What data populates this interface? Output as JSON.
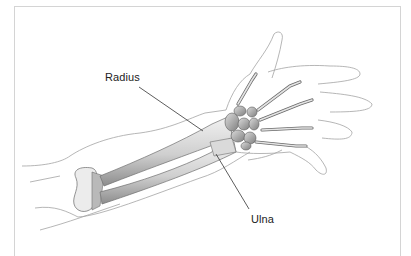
{
  "figure": {
    "labels": [
      {
        "id": "radius",
        "text": "Radius",
        "leader": {
          "x1": 139,
          "y1": 87,
          "x2": 203,
          "y2": 131
        }
      },
      {
        "id": "ulna",
        "text": "Ulna",
        "leader": {
          "x1": 216,
          "y1": 154,
          "x2": 249,
          "y2": 209
        }
      }
    ],
    "colors": {
      "background": "#ffffff",
      "frame": "#d4d4d4",
      "outline": "#9a9a9a",
      "bone": "#e6e6e6",
      "bone_shade": "#8a8a8a",
      "leader": "#333333"
    }
  }
}
